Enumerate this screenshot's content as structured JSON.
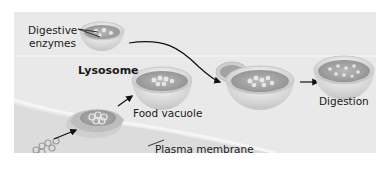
{
  "diagram": {
    "labels": {
      "digestive_enzymes_line1": "Digestive",
      "digestive_enzymes_line2": "enzymes",
      "lysosome": "Lysosome",
      "food_vacuole": "Food vacuole",
      "plasma_membrane": "Plasma membrane",
      "digestion": "Digestion"
    },
    "stages": [
      {
        "id": "lysosome",
        "label": "Lysosome"
      },
      {
        "id": "engulfment",
        "label": ""
      },
      {
        "id": "food-vacuole",
        "label": "Food vacuole"
      },
      {
        "id": "fusion",
        "label": ""
      },
      {
        "id": "digestion",
        "label": "Digestion"
      }
    ],
    "colors": {
      "panel_bg": "#e9e9e9",
      "vesicle_outer": "#d9d9d9",
      "vesicle_inner": "#a9a9a9",
      "arrow": "#111111",
      "text": "#1a1a1a"
    }
  }
}
